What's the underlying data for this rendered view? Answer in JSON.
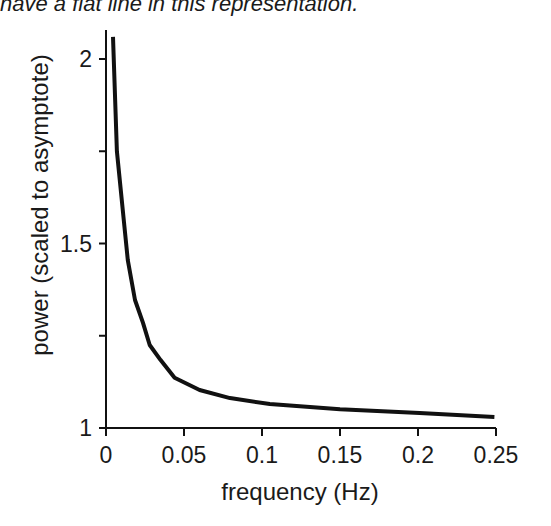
{
  "caption": "have a flat line in this representation.",
  "chart_data": {
    "type": "line",
    "title": "",
    "xlabel": "frequency (Hz)",
    "ylabel": "power (scaled to asymptote)",
    "xlim": [
      0,
      0.25
    ],
    "ylim": [
      1,
      2.1
    ],
    "x_ticks": [
      0,
      0.05,
      0.1,
      0.15,
      0.2,
      0.25
    ],
    "x_tick_labels": [
      "0",
      "0.05",
      "0.1",
      "0.15",
      "0.2",
      "0.25"
    ],
    "y_ticks": [
      1,
      1.25,
      1.5,
      1.75,
      2
    ],
    "y_tick_labels": [
      "1",
      "",
      "1.5",
      "",
      "2"
    ],
    "grid": false,
    "legend": null,
    "series": [
      {
        "name": "power spectrum",
        "color": "#111111",
        "x": [
          0.0045,
          0.007,
          0.0115,
          0.014,
          0.0186,
          0.0237,
          0.028,
          0.035,
          0.044,
          0.06,
          0.0795,
          0.105,
          0.15,
          0.201,
          0.249
        ],
        "y": [
          2.06,
          1.75,
          1.56,
          1.455,
          1.347,
          1.285,
          1.225,
          1.184,
          1.136,
          1.103,
          1.081,
          1.065,
          1.051,
          1.041,
          1.03
        ]
      }
    ]
  }
}
